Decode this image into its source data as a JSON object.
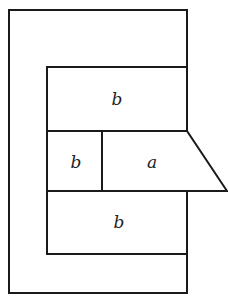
{
  "diagram": {
    "labels": {
      "top_block": "b",
      "middle_left_block": "b",
      "middle_right_block": "a",
      "bottom_block": "b"
    },
    "stroke_color": "#1a1a1a",
    "background": "#ffffff"
  }
}
